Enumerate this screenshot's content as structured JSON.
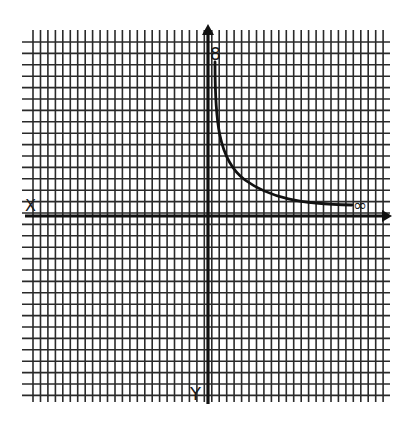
{
  "diagram": {
    "type": "hand-drawn graph on grid paper",
    "grid": {
      "x_start": 25,
      "x_end": 390,
      "x_spacing": 7.45,
      "y_start": 30,
      "y_end": 402,
      "y_spacing": 11.4,
      "line_color": "#2a2a2a"
    },
    "axes": {
      "x_axis_y": 216,
      "y_axis_x": 208,
      "color": "#111111"
    },
    "labels": {
      "y_axis_top": "8",
      "x_axis_right": "∞",
      "x_axis_left": "X",
      "y_axis_bottom": "Y"
    },
    "curve": {
      "description": "Decreasing hyperbola-like curve approaching the y-axis at top and the x-axis at right",
      "path": "M 215 62 C 215 120, 218 160, 245 180 C 270 198, 300 204, 352 205"
    }
  }
}
